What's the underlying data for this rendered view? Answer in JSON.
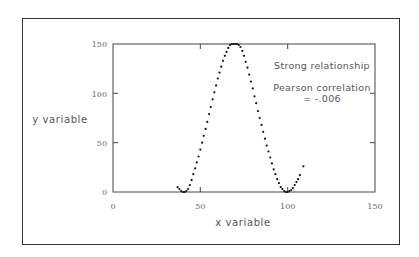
{
  "chart_data": {
    "type": "scatter",
    "title": "",
    "xlabel": "x variable",
    "ylabel": "y variable",
    "xlim": [
      0,
      150
    ],
    "ylim": [
      0,
      150
    ],
    "xticks": [
      0,
      50,
      100,
      150
    ],
    "yticks": [
      0,
      50,
      100,
      150
    ],
    "grid": false,
    "legend": null,
    "annotations": [
      "Strong relationship",
      "Pearson correlation",
      "= -.006"
    ],
    "series": [
      {
        "name": "data",
        "x": [
          37,
          38,
          39,
          40,
          41,
          42,
          43,
          44,
          45,
          46,
          47,
          48,
          49,
          50,
          51,
          52,
          53,
          54,
          55,
          56,
          57,
          58,
          59,
          60,
          61,
          62,
          63,
          64,
          65,
          66,
          67,
          68,
          69,
          70,
          71,
          72,
          73,
          74,
          75,
          76,
          77,
          78,
          79,
          80,
          81,
          82,
          83,
          84,
          85,
          86,
          87,
          88,
          89,
          90,
          91,
          92,
          93,
          94,
          95,
          96,
          97,
          98,
          99,
          100,
          101,
          102,
          103,
          104,
          105,
          106,
          107,
          109
        ],
        "y": [
          5,
          3,
          1,
          0,
          0,
          1,
          3,
          7,
          12,
          18,
          24,
          30,
          36,
          43,
          50,
          57,
          64,
          71,
          79,
          86,
          94,
          101,
          108,
          115,
          121,
          127,
          133,
          138,
          142,
          146,
          149,
          150,
          150,
          150,
          150,
          149,
          147,
          143,
          138,
          132,
          126,
          119,
          112,
          105,
          97,
          90,
          82,
          75,
          68,
          61,
          54,
          47,
          41,
          35,
          29,
          23,
          18,
          13,
          9,
          5,
          3,
          1,
          0,
          0,
          1,
          2,
          4,
          7,
          10,
          13,
          17,
          26
        ]
      }
    ]
  },
  "axes": {
    "x_ticks": [
      "0",
      "50",
      "100",
      "150"
    ],
    "y_ticks": [
      "0",
      "50",
      "100",
      "150"
    ],
    "x_label": "x variable",
    "y_label": "y variable"
  },
  "annotations": {
    "line1": "Strong relationship",
    "line2": "Pearson correlation",
    "line3": "= -.006"
  }
}
